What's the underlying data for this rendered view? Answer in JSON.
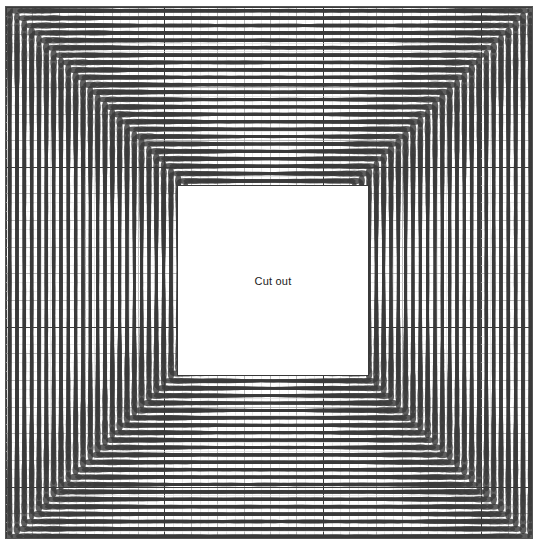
{
  "figure": {
    "width": 546,
    "height": 554,
    "background_color": "#ffffff",
    "border_color": "#555555"
  },
  "cutout": {
    "label": "Cut out",
    "x": 176,
    "y": 184,
    "width": 192,
    "height": 191,
    "fill_color": "#ffffff",
    "border_color": "#3a3a3a",
    "text_color": "#1a1a1a"
  },
  "grid": {
    "minor_color": "#d9d9d9",
    "major_color": "#9a9a9a",
    "heavy_color": "#3c3c3c",
    "minor_step_x": 8.8,
    "minor_step_y": 8.88,
    "major_every": 3,
    "heavy_every": 18,
    "show": true
  },
  "chart_data": {
    "type": "scatter",
    "title": "",
    "subtitle": "",
    "xlabel": "",
    "ylabel": "",
    "annotations": [
      "Cut out"
    ],
    "legend": [],
    "grid": true,
    "panel_rows": 8,
    "panel_cols": 8,
    "cells_per_panel_rows": 9,
    "cells_per_panel_cols": 9,
    "glyph": "ellipse",
    "glyph_fill": "#3a3a3a",
    "glyph_opacity": 0.82,
    "xlim": [
      0,
      72
    ],
    "ylim": [
      0,
      72
    ],
    "series": [
      {
        "name": "ellipse-field",
        "values": []
      }
    ]
  }
}
